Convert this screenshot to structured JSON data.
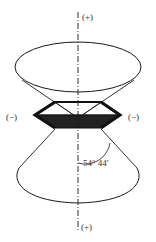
{
  "diagram": {
    "title": "",
    "labels": {
      "top_pole": "(+)",
      "bottom_pole": "(+)",
      "left_side": "(−)",
      "right_side": "(−)",
      "angle": "54° 44′"
    },
    "elements": [
      {
        "type": "axis",
        "style": "dash-dot",
        "orientation": "vertical"
      },
      {
        "type": "cone",
        "position": "upper",
        "shape": "open cone with elliptical rim"
      },
      {
        "type": "cone",
        "position": "lower",
        "shape": "open cone with elliptical rim"
      },
      {
        "type": "hexagon",
        "position": "center",
        "bottom_half": "shaded dark"
      }
    ],
    "colors": {
      "line": "#1a1a1a",
      "fill_dark": "#222222",
      "background": "#ffffff",
      "text": "#333333"
    }
  }
}
